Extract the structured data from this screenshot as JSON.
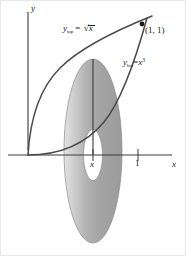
{
  "figure": {
    "background_color": "#ffffff",
    "curve_color": "#4a4a4a",
    "axis_color": "#3a3a3a",
    "solid_fill_color": "#a9a9a9",
    "solid_highlight_color": "#d8d8d8",
    "hole_fill_color": "#ffffff"
  },
  "axes": {
    "x_label": "x",
    "y_label": "y",
    "x_ticks": [
      {
        "label": "x",
        "value": "x"
      },
      {
        "label": "1",
        "value": "1"
      }
    ]
  },
  "curves": [
    {
      "name": "y-top",
      "label_prefix": "y",
      "label_subscript": "top",
      "label_equals": "=",
      "label_expression": "x",
      "label_radical": true,
      "label_exponent": "",
      "equation": "y_top = sqrt(x)"
    },
    {
      "name": "y-bot",
      "label_prefix": "y",
      "label_subscript": "bot",
      "label_equals": "=",
      "label_expression": "x",
      "label_radical": false,
      "label_exponent": "3",
      "equation": "y_bot = x^3"
    }
  ],
  "annotations": {
    "intersection_point_label": "(1, 1)"
  }
}
